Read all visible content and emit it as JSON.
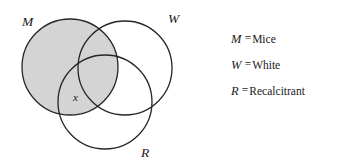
{
  "diagram": {
    "type": "venn-three-circle",
    "shaded_region_description": "entire M circle",
    "shade_color": "#d4d4d4",
    "stroke_color": "#262626",
    "background_color": "#ffffff",
    "circles": [
      {
        "id": "M",
        "label": "M",
        "cx": 70,
        "cy": 67,
        "r": 48,
        "label_x": 22,
        "label_y": 26,
        "shaded": true
      },
      {
        "id": "W",
        "label": "W",
        "cx": 125,
        "cy": 68,
        "r": 47,
        "label_x": 168,
        "label_y": 23,
        "shaded": false
      },
      {
        "id": "R",
        "label": "R",
        "cx": 105,
        "cy": 102,
        "r": 47,
        "label_x": 141,
        "label_y": 157,
        "shaded": false
      }
    ],
    "markers": [
      {
        "id": "x",
        "label": "x",
        "x": 73,
        "y": 101,
        "region": "M and R, not W"
      }
    ]
  },
  "legend": {
    "equals_sign": "=",
    "items": [
      {
        "symbol": "M",
        "term": "Mice"
      },
      {
        "symbol": "W",
        "term": "White"
      },
      {
        "symbol": "R",
        "term": "Recalcitrant"
      }
    ]
  }
}
